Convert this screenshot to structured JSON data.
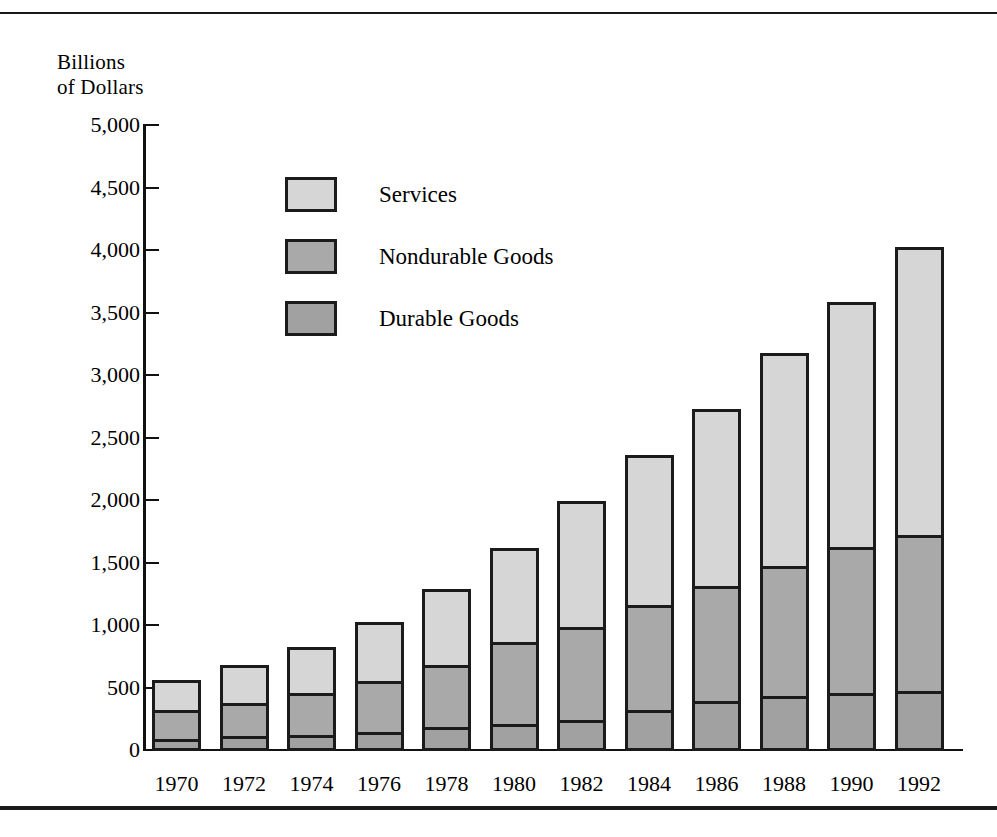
{
  "figure": {
    "axis_title_lines": [
      "Billions",
      "of Dollars"
    ]
  },
  "chart_data": {
    "type": "bar",
    "stacked": true,
    "title": "",
    "subtitle": "",
    "xlabel": "",
    "ylabel": "Billions of Dollars",
    "ylim": [
      0,
      5000
    ],
    "ytick_labels": [
      "5,000",
      "4,500",
      "4,000",
      "3,500",
      "3,000",
      "2,500",
      "2,000",
      "1,500",
      "1,000",
      "500",
      "0"
    ],
    "ytick_values": [
      5000,
      4500,
      4000,
      3500,
      3000,
      2500,
      2000,
      1500,
      1000,
      500,
      0
    ],
    "grid": false,
    "legend_position": "upper-left-inside",
    "categories": [
      "1970",
      "1972",
      "1974",
      "1976",
      "1978",
      "1980",
      "1982",
      "1984",
      "1986",
      "1988",
      "1990",
      "1992"
    ],
    "series": [
      {
        "name": "Durable Goods",
        "color": "#a1a1a1",
        "values": [
          95,
          120,
          125,
          155,
          195,
          215,
          250,
          330,
          400,
          440,
          465,
          480
        ]
      },
      {
        "name": "Nondurable Goods",
        "color": "#a9a9a9",
        "values": [
          255,
          285,
          360,
          430,
          520,
          680,
          770,
          865,
          945,
          1065,
          1195,
          1270
        ]
      },
      {
        "name": "Services",
        "color": "#d6d6d6",
        "values": [
          270,
          330,
          395,
          495,
          630,
          775,
          1030,
          1225,
          1440,
          1725,
          1980,
          2330
        ]
      }
    ],
    "totals": [
      620,
      735,
      880,
      1080,
      1345,
      1670,
      2050,
      2420,
      2785,
      3230,
      3640,
      4080
    ]
  }
}
